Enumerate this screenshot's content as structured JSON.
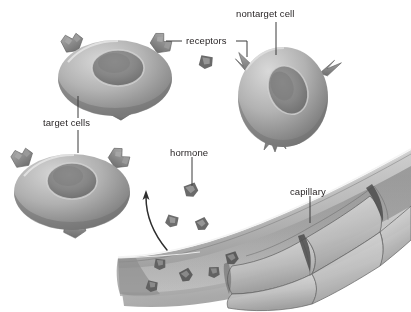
{
  "figure": {
    "domain": "diagram",
    "background_color": "#ffffff",
    "style": "grayscale airbrushed biological illustration",
    "text_color": "#231f20",
    "leader_line_color": "#3a3a3a",
    "font_size_px": 9.5
  },
  "labels": [
    {
      "id": "nontarget-cell",
      "text": "nontarget cell",
      "x": 236,
      "y": 9,
      "anchor": "start"
    },
    {
      "id": "receptors",
      "text": "receptors",
      "x": 186,
      "y": 44,
      "anchor": "start"
    },
    {
      "id": "target-cells",
      "text": "target cells",
      "x": 43,
      "y": 122,
      "anchor": "start"
    },
    {
      "id": "hormone",
      "text": "hormone",
      "x": 170,
      "y": 152,
      "anchor": "start"
    },
    {
      "id": "capillary",
      "text": "capillary",
      "x": 290,
      "y": 191,
      "anchor": "start"
    }
  ],
  "leader_lines": [
    {
      "id": "leader-nontarget-cell",
      "from_label": "nontarget cell",
      "path": "M 276 22 L 276 55"
    },
    {
      "id": "leader-receptors-left",
      "from_label": "receptors",
      "path": "M 182 41 L 166 41"
    },
    {
      "id": "leader-receptors-right",
      "from_label": "receptors",
      "path": "M 236 41 L 247 41 L 247 56"
    },
    {
      "id": "leader-target-cells-up",
      "from_label": "target cells",
      "path": "M 78 118 L 78 95"
    },
    {
      "id": "leader-target-cells-down",
      "from_label": "target cells",
      "path": "M 78 130 L 78 152"
    },
    {
      "id": "leader-hormone",
      "from_label": "hormone",
      "path": "M 192 156 L 192 186"
    },
    {
      "id": "leader-capillary",
      "from_label": "capillary",
      "path": "M 310 195 L 310 222"
    }
  ],
  "cells": [
    {
      "id": "target-cell-upper-left",
      "type": "target cell",
      "label_ref": "target cells",
      "center": [
        115,
        78
      ],
      "radius_x": 57,
      "radius_y": 38,
      "nucleus": {
        "cx": 118,
        "cy": 68,
        "rx": 26,
        "ry": 18
      },
      "receptor_style": "blocky notched Y",
      "receptor_count": 3,
      "receptors": [
        {
          "x": 72,
          "y": 42,
          "rot": -32
        },
        {
          "x": 160,
          "y": 42,
          "rot": 30
        },
        {
          "x": 120,
          "y": 110,
          "rot": 6
        }
      ]
    },
    {
      "id": "target-cell-lower-left",
      "type": "target cell",
      "label_ref": "target cells",
      "center": [
        72,
        192
      ],
      "radius_x": 58,
      "radius_y": 38,
      "nucleus": {
        "cx": 72,
        "cy": 181,
        "rx": 25,
        "ry": 18
      },
      "receptor_style": "blocky notched Y",
      "receptor_count": 3,
      "receptors": [
        {
          "x": 22,
          "y": 157,
          "rot": -34
        },
        {
          "x": 118,
          "y": 157,
          "rot": 32
        },
        {
          "x": 74,
          "y": 228,
          "rot": 4
        }
      ]
    },
    {
      "id": "nontarget-cell",
      "type": "nontarget cell",
      "label_ref": "nontarget cell",
      "center": [
        283,
        97
      ],
      "radius_x": 45,
      "radius_y": 50,
      "nucleus": {
        "cx": 288,
        "cy": 90,
        "rx": 19,
        "ry": 25,
        "rot": -22
      },
      "receptor_style": "sharp pointed spike (non-matching)",
      "receptor_count": 3,
      "receptors": [
        {
          "x": 243,
          "y": 66,
          "rot": -48
        },
        {
          "x": 325,
          "y": 72,
          "rot": 46
        },
        {
          "x": 275,
          "y": 140,
          "rot": 4
        }
      ]
    }
  ],
  "hormones": {
    "description": "small dark blocky hormone molecules",
    "free_molecules": [
      {
        "id": "hormone-near-receptors",
        "x": 206,
        "y": 62,
        "size": 13,
        "rot": 18
      },
      {
        "id": "hormone-labeled",
        "x": 191,
        "y": 190,
        "size": 13,
        "rot": -12
      },
      {
        "id": "hormone-free-left",
        "x": 172,
        "y": 221,
        "size": 12,
        "rot": 25
      },
      {
        "id": "hormone-free-right",
        "x": 202,
        "y": 224,
        "size": 12,
        "rot": -18
      }
    ],
    "in_capillary": [
      {
        "id": "hormone-lumen-1",
        "x": 160,
        "y": 264,
        "size": 11,
        "rot": 14
      },
      {
        "id": "hormone-lumen-2",
        "x": 186,
        "y": 275,
        "size": 12,
        "rot": -20
      },
      {
        "id": "hormone-lumen-3",
        "x": 214,
        "y": 272,
        "size": 11,
        "rot": 8
      },
      {
        "id": "hormone-lumen-4",
        "x": 232,
        "y": 258,
        "size": 12,
        "rot": -10
      },
      {
        "id": "hormone-lumen-5",
        "x": 152,
        "y": 286,
        "size": 11,
        "rot": 22
      }
    ]
  },
  "arrow": {
    "id": "hormone-release-arrow",
    "description": "curved arrow from capillary wall up toward the target cells",
    "path": "M 167 250 C 152 232, 146 214, 146 196",
    "head_at": [
      146,
      192
    ],
    "color": "#2e2e2e"
  },
  "capillary": {
    "id": "capillary",
    "label_ref": "capillary",
    "description": "curved blood vessel crossing the lower right, lined with polygonal endothelial cells",
    "endothelial_cell_count": 11,
    "orientation": "lower-left to upper-right, curving upward"
  },
  "palette": {
    "cell_light": "#c9c9c9",
    "cell_mid": "#9d9d9d",
    "cell_dark": "#6e6e6e",
    "nucleus_dark": "#6a6a6a",
    "receptor": "#7e7e7e",
    "hormone": "#6a6a6a",
    "capillary_light": "#d5d5d5",
    "capillary_mid": "#a6a6a6",
    "capillary_dark": "#5c5c5c"
  }
}
